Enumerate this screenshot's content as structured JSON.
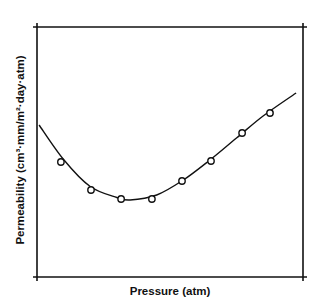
{
  "chart_data": {
    "type": "scatter",
    "title": "",
    "xlabel": "Pressure (atm)",
    "ylabel": "Permeability (cm³·mm/m²·day·atm)",
    "xlim": [
      0,
      10
    ],
    "ylim": [
      0,
      10
    ],
    "x_ticks": [],
    "y_ticks": [],
    "grid": false,
    "legend": null,
    "note": "Schematic plot without numeric tick labels; values are normalized 0–10 estimates read from position.",
    "series": [
      {
        "name": "Measured",
        "marker": "open-circle",
        "x": [
          0.9,
          2.03,
          3.16,
          4.32,
          5.45,
          6.54,
          7.71,
          8.76
        ],
        "y": [
          4.6,
          3.48,
          3.12,
          3.12,
          3.84,
          4.64,
          5.76,
          6.56
        ]
      },
      {
        "name": "Fitted curve",
        "style": "line",
        "x": [
          0.08,
          1.0,
          2.0,
          3.0,
          3.5,
          4.5,
          5.5,
          6.5,
          7.5,
          8.5,
          9.74
        ],
        "y": [
          6.08,
          4.7,
          3.62,
          3.18,
          3.08,
          3.28,
          3.88,
          4.68,
          5.56,
          6.44,
          7.36
        ]
      }
    ]
  },
  "axes": {
    "x_label": "Pressure (atm)",
    "y_label": "Permeability (cm³·mm/m²·day·atm)"
  },
  "style": {
    "line_color": "#111111",
    "marker_color": "#111111",
    "background": "#ffffff"
  }
}
